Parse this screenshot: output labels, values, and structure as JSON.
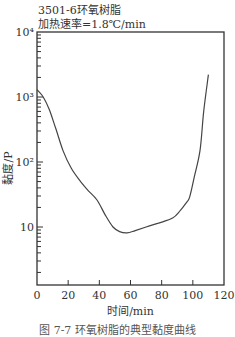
{
  "chart_data": {
    "type": "line",
    "title": "3501-6环氧树脂",
    "subtitle": "加热速率=1.8℃/min",
    "xlabel": "时间/min",
    "ylabel": "黏度/P",
    "caption": "图 7-7 环氧树脂的典型黏度曲线",
    "xlim": [
      0,
      120
    ],
    "ylim": [
      1.35,
      10000
    ],
    "yscale": "log",
    "x_ticks": [
      0,
      20,
      40,
      60,
      80,
      100,
      120
    ],
    "x_tick_labels": [
      "0",
      "20",
      "40",
      "60",
      "80",
      "100",
      "120"
    ],
    "y_major_ticks": [
      10,
      100,
      1000,
      10000
    ],
    "y_tick_labels": [
      "10",
      "10²",
      "10³",
      "10⁴"
    ],
    "grid": false,
    "series": [
      {
        "name": "3501-6",
        "x": [
          0,
          4,
          8,
          12,
          16.7,
          22,
          28,
          33,
          38.5,
          44,
          48.8,
          53,
          57.8,
          63,
          70,
          78,
          87,
          92,
          96,
          98,
          101,
          104.6,
          107,
          110
        ],
        "values": [
          1300,
          1000,
          630,
          330,
          150,
          80,
          50,
          36,
          26,
          15,
          10,
          8.5,
          8.1,
          8.8,
          10,
          11.5,
          13.7,
          18,
          24,
          29,
          60,
          150,
          600,
          2200
        ]
      }
    ]
  }
}
